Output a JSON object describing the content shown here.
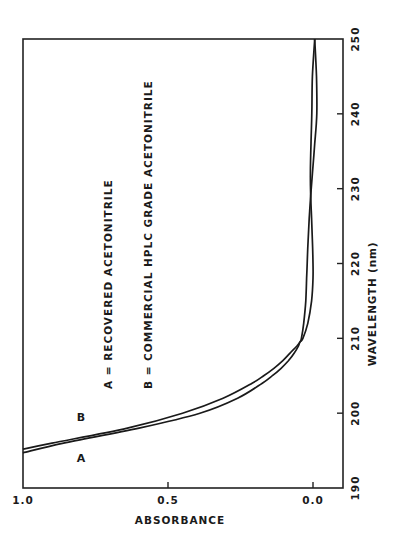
{
  "chart_data": {
    "type": "line",
    "title": "",
    "xlabel": "WAVELENGTH (nm)",
    "ylabel": "ABSORBANCE",
    "xlim": [
      190,
      250
    ],
    "ylim": [
      -0.1,
      1.0
    ],
    "xticks": [
      190,
      200,
      210,
      220,
      230,
      240,
      250
    ],
    "xtick_labels": [
      "190",
      "200",
      "210",
      "220",
      "230",
      "240",
      "250"
    ],
    "yticks": [
      0.0,
      0.5,
      1.0
    ],
    "ytick_labels": [
      "0.0",
      "0.5",
      "1.0"
    ],
    "grid": false,
    "orientation": "rotated 90 degrees counter-clockwise",
    "series": [
      {
        "name": "A",
        "label": "A",
        "x": [
          194.7,
          196,
          198,
          200,
          202,
          204,
          205,
          206,
          207,
          208,
          209,
          209.5,
          210,
          212,
          215,
          218,
          220,
          223,
          226,
          229,
          232,
          236,
          240,
          245,
          250
        ],
        "y": [
          1.0,
          0.86,
          0.6,
          0.39,
          0.26,
          0.175,
          0.14,
          0.11,
          0.085,
          0.065,
          0.05,
          0.045,
          0.035,
          0.018,
          0.005,
          0.0,
          0.0,
          0.002,
          0.005,
          0.008,
          0.009,
          0.007,
          0.004,
          0.002,
          -0.006
        ]
      },
      {
        "name": "B",
        "label": "B",
        "x": [
          195.2,
          196,
          198,
          200,
          202,
          204,
          205,
          206,
          207,
          208,
          209,
          209.5,
          210,
          212,
          215,
          218,
          220,
          223,
          226,
          229,
          232,
          236,
          240,
          245,
          250
        ],
        "y": [
          1.0,
          0.9,
          0.64,
          0.45,
          0.31,
          0.21,
          0.17,
          0.135,
          0.105,
          0.08,
          0.055,
          0.045,
          0.04,
          0.032,
          0.025,
          0.022,
          0.02,
          0.017,
          0.013,
          0.008,
          0.002,
          -0.006,
          -0.013,
          -0.012,
          -0.006
        ]
      }
    ],
    "annotations": [
      {
        "text": "A = RECOVERED ACETONITRILE"
      },
      {
        "text": "B = COMMERCIAL HPLC GRADE ACETONITRILE"
      }
    ]
  }
}
